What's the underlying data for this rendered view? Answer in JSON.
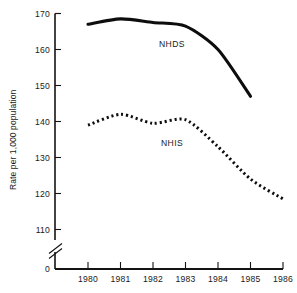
{
  "chart_data": {
    "type": "line",
    "title": "",
    "xlabel": "",
    "ylabel": "Rate per 1,000 population",
    "categories": [
      "1980",
      "1981",
      "1982",
      "1983",
      "1984",
      "1985",
      "1986"
    ],
    "x": [
      1980,
      1981,
      1982,
      1983,
      1984,
      1985,
      1986
    ],
    "xlim": [
      1979.6,
      1986.4
    ],
    "ylim": [
      110,
      170
    ],
    "y_axis_break": true,
    "y_axis_break_between": [
      0,
      110
    ],
    "yticks": [
      "0",
      "110",
      "120",
      "130",
      "140",
      "150",
      "160",
      "170"
    ],
    "ytick_values": [
      0,
      110,
      120,
      130,
      140,
      150,
      160,
      170
    ],
    "grid": false,
    "legend_position": "inline-annotation",
    "series": [
      {
        "name": "NHDS",
        "style": "solid",
        "label_text": "NHDS",
        "x": [
          1980,
          1981,
          1982,
          1983,
          1984,
          1985
        ],
        "values": [
          167.0,
          168.5,
          167.5,
          166.5,
          160.0,
          147.0
        ]
      },
      {
        "name": "NHIS",
        "style": "dotted",
        "label_text": "NHIS",
        "x": [
          1980,
          1981,
          1982,
          1983,
          1984,
          1985,
          1986
        ],
        "values": [
          139.0,
          142.0,
          139.5,
          140.5,
          133.0,
          124.0,
          118.5
        ]
      }
    ],
    "annotations": [
      {
        "text": "NHDS",
        "x": 1982.6,
        "y": 162.0
      },
      {
        "text": "NHIS",
        "x": 1982.6,
        "y": 134.8
      }
    ]
  }
}
